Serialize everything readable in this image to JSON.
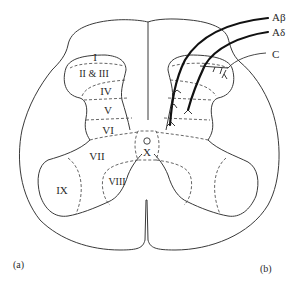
{
  "figure": {
    "panels": [
      {
        "id": "a",
        "label": "(a)"
      },
      {
        "id": "b",
        "label": "(b)"
      }
    ],
    "laminae": [
      {
        "id": "I",
        "label": "I"
      },
      {
        "id": "II_III",
        "label": "II & III"
      },
      {
        "id": "IV",
        "label": "IV"
      },
      {
        "id": "V",
        "label": "V"
      },
      {
        "id": "VI",
        "label": "VI"
      },
      {
        "id": "VII",
        "label": "VII"
      },
      {
        "id": "VIII",
        "label": "VIII"
      },
      {
        "id": "IX",
        "label": "IX"
      },
      {
        "id": "X",
        "label": "X"
      }
    ],
    "central_canal_symbol": "O",
    "fibers": [
      {
        "id": "a_beta",
        "label": "Aβ"
      },
      {
        "id": "a_delta",
        "label": "Aδ"
      },
      {
        "id": "c",
        "label": "C"
      }
    ]
  }
}
